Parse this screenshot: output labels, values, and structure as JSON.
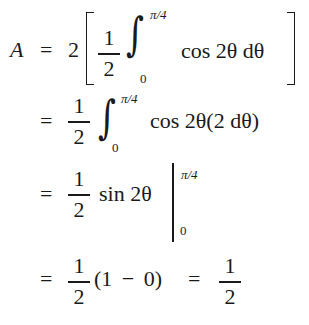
{
  "equation": {
    "line1": {
      "lhs": "A",
      "eq": "=",
      "coef": "2",
      "frac": {
        "num": "1",
        "den": "2"
      },
      "integral": "∫",
      "upper": "π/4",
      "lower": "0",
      "integrand": "cos 2θ dθ"
    },
    "line2": {
      "eq": "=",
      "frac": {
        "num": "1",
        "den": "2"
      },
      "integral": "∫",
      "upper": "π/4",
      "lower": "0",
      "integrand": "cos 2θ(2 dθ)"
    },
    "line3": {
      "eq": "=",
      "frac": {
        "num": "1",
        "den": "2"
      },
      "expr": "sin 2θ",
      "upper": "π/4",
      "lower": "0"
    },
    "line4": {
      "eq": "=",
      "frac": {
        "num": "1",
        "den": "2"
      },
      "expr": "(1 − 0)",
      "eq2": "=",
      "result_frac": {
        "num": "1",
        "den": "2"
      }
    }
  }
}
